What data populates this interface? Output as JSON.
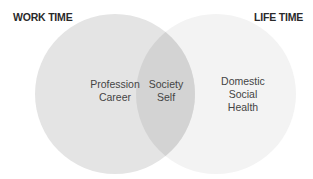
{
  "headings": {
    "left": "WORK TIME",
    "right": "LIFE TIME"
  },
  "circles": {
    "left": {
      "lines": [
        "Profession",
        "Career"
      ],
      "color": "#e4e4e4"
    },
    "overlap": {
      "lines": [
        "Society",
        "Self"
      ],
      "color": "#d3d3d3"
    },
    "right": {
      "lines": [
        "Domestic",
        "Social",
        "Health"
      ],
      "color": "#f3f3f3"
    }
  }
}
